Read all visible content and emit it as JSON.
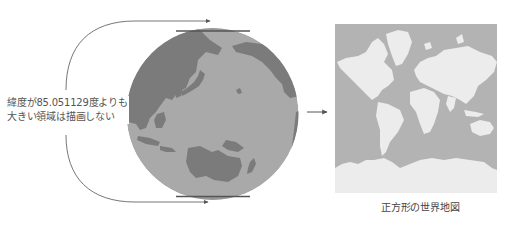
{
  "annotation": {
    "line1": "緯度が85.051129度よりも",
    "line2": "大きい領域は描画しない"
  },
  "caption": "正方形の世界地図",
  "colors": {
    "globe_ocean": "#a9a9a9",
    "globe_land": "#7b7b7b",
    "globe_cut_band": "#8e8e8e",
    "cut_line": "#555555",
    "map_ocean": "#b3b3b3",
    "map_land": "#ececec",
    "arrow": "#555555",
    "bracket": "#666666"
  },
  "diagram": {
    "left_element": "globe centered on Pacific with top/bottom polar caps cut off",
    "arrow_direction": "right",
    "right_element": "square Mercator world map"
  }
}
